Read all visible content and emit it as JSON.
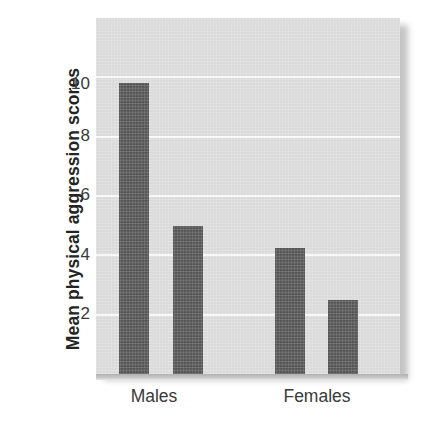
{
  "chart_data": {
    "type": "bar",
    "title": "",
    "subtitle": "",
    "xlabel": "",
    "ylabel": "Mean physical aggression scores",
    "categories": [
      "Males",
      "Females"
    ],
    "series": [
      {
        "name": "Bar 1",
        "values": [
          9.8,
          4.25
        ]
      },
      {
        "name": "Bar 2",
        "values": [
          5.0,
          2.5
        ]
      }
    ],
    "bars": [
      {
        "group": "Males",
        "index": 0,
        "value": 9.8
      },
      {
        "group": "Males",
        "index": 1,
        "value": 5.0
      },
      {
        "group": "Females",
        "index": 0,
        "value": 4.25
      },
      {
        "group": "Females",
        "index": 1,
        "value": 2.5
      }
    ],
    "ylim": [
      0,
      12
    ],
    "yticks": [
      2,
      4,
      6,
      8,
      10
    ],
    "ytick_labels": [
      "2",
      "4",
      "6",
      "8",
      "10"
    ],
    "grid": true,
    "legend": null,
    "legend_position": "none",
    "colors": {
      "bar": "#585858",
      "plot_background": "#dedede",
      "gridline": "#fbfbfb",
      "text": "#3a3a3a",
      "axis_title": "#242424",
      "page_background": "#ffffff"
    }
  },
  "axis": {
    "y_title": "Mean physical aggression scores",
    "tick_2": "2",
    "tick_4": "4",
    "tick_6": "6",
    "tick_8": "8",
    "tick_10": "10"
  },
  "categories": {
    "males": "Males",
    "females": "Females"
  }
}
